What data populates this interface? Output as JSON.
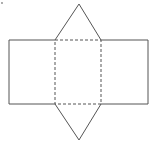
{
  "diagram": {
    "stroke_color": "#555555",
    "background": "#ffffff",
    "marks": {
      "corner_dot": "·"
    },
    "shapes": {
      "left_rect": {
        "x": 9,
        "y": 40,
        "w": 46,
        "h": 64,
        "style": "solid"
      },
      "center_rect": {
        "x": 55,
        "y": 40,
        "w": 46,
        "h": 64,
        "style": "dashed"
      },
      "right_rect": {
        "x": 101,
        "y": 40,
        "w": 47,
        "h": 64,
        "style": "solid"
      },
      "top_triangle": {
        "points": "55,40 79,4 101,40",
        "style": "solid"
      },
      "bottom_triangle": {
        "points": "55,104 79,140 101,104",
        "style": "solid"
      }
    }
  }
}
